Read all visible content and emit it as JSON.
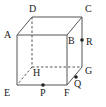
{
  "figure": {
    "type": "geometry-diagram",
    "shape": "cube",
    "stroke_color": "#555555",
    "label_color": "#1a1a1a",
    "point_color": "#222222",
    "background_color": "#ffffff",
    "vertices": [
      {
        "name": "A",
        "label": "A",
        "x": 17,
        "y": 35,
        "hidden": false,
        "label_x": 4,
        "label_y": 30
      },
      {
        "name": "B",
        "label": "B",
        "x": 67,
        "y": 35,
        "hidden": false,
        "label_x": 68,
        "label_y": 36
      },
      {
        "name": "C",
        "label": "C",
        "x": 82,
        "y": 17,
        "hidden": false,
        "label_x": 85,
        "label_y": 4
      },
      {
        "name": "D",
        "label": "D",
        "x": 32,
        "y": 17,
        "hidden": false,
        "label_x": 29,
        "label_y": 4
      },
      {
        "name": "E",
        "label": "E",
        "x": 17,
        "y": 85,
        "hidden": false,
        "label_x": 4,
        "label_y": 88
      },
      {
        "name": "F",
        "label": "F",
        "x": 67,
        "y": 85,
        "hidden": false,
        "label_x": 64,
        "label_y": 88
      },
      {
        "name": "G",
        "label": "G",
        "x": 82,
        "y": 67,
        "hidden": false,
        "label_x": 85,
        "label_y": 66
      },
      {
        "name": "H",
        "label": "H",
        "x": 32,
        "y": 67,
        "hidden": true,
        "label_x": 33,
        "label_y": 68
      }
    ],
    "edges": [
      {
        "name": "edge-AB",
        "from": "A",
        "to": "B",
        "style": "solid"
      },
      {
        "name": "edge-BF",
        "from": "B",
        "to": "F",
        "style": "solid"
      },
      {
        "name": "edge-FE",
        "from": "F",
        "to": "E",
        "style": "solid"
      },
      {
        "name": "edge-EA",
        "from": "E",
        "to": "A",
        "style": "solid"
      },
      {
        "name": "edge-DC",
        "from": "D",
        "to": "C",
        "style": "solid"
      },
      {
        "name": "edge-CG",
        "from": "C",
        "to": "G",
        "style": "solid"
      },
      {
        "name": "edge-GF",
        "from": "G",
        "to": "F",
        "style": "solid"
      },
      {
        "name": "edge-AD",
        "from": "A",
        "to": "D",
        "style": "solid"
      },
      {
        "name": "edge-BC",
        "from": "B",
        "to": "C",
        "style": "solid"
      },
      {
        "name": "edge-DH",
        "from": "D",
        "to": "H",
        "style": "dashed"
      },
      {
        "name": "edge-HG",
        "from": "H",
        "to": "G",
        "style": "dashed"
      },
      {
        "name": "edge-HE",
        "from": "H",
        "to": "E",
        "style": "dashed"
      }
    ],
    "points": [
      {
        "name": "P",
        "label": "P",
        "x": 43,
        "y": 85,
        "on_edge": "EF",
        "label_x": 40,
        "label_y": 88
      },
      {
        "name": "Q",
        "label": "Q",
        "x": 76,
        "y": 77,
        "on_edge": "FG",
        "label_x": 74,
        "label_y": 79
      },
      {
        "name": "R",
        "label": "R",
        "x": 82,
        "y": 40,
        "on_edge": "CG",
        "label_x": 86,
        "label_y": 37
      }
    ]
  }
}
